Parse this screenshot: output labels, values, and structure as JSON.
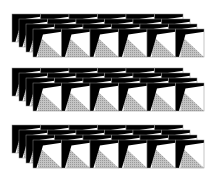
{
  "figure": {
    "width": 216,
    "height": 177,
    "background": "#ffffff",
    "colors": {
      "black": "#000000",
      "white": "#ffffff",
      "gray": "#c4c4c4",
      "gray_dot": "#9a9a9a",
      "outline": "#8a8a8a"
    },
    "groups": [
      {
        "name": "group-1",
        "x": 12,
        "y": 14
      },
      {
        "name": "group-2",
        "x": 12,
        "y": 68
      },
      {
        "name": "group-3",
        "x": 12,
        "y": 125
      }
    ],
    "rows_per_group": 4,
    "tiles_per_row": 6,
    "tile": {
      "width": 28.5,
      "height": 28
    },
    "row_offset": {
      "dx": 7,
      "dy": 5
    }
  }
}
